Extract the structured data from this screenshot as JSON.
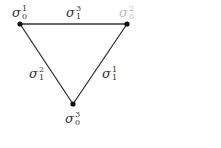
{
  "diagram": {
    "type": "triangle-simplicial-complex",
    "line_color": "#333333",
    "vertex_color": "#111111",
    "vertices": [
      {
        "id": "v-top-left",
        "symbol": "σ",
        "sub": "0",
        "sup": "1",
        "x": 20,
        "y": 24,
        "faded": false
      },
      {
        "id": "v-top-right",
        "symbol": "σ",
        "sub": "0",
        "sup": "2",
        "x": 127,
        "y": 24,
        "faded": true
      },
      {
        "id": "v-bottom",
        "symbol": "σ",
        "sub": "0",
        "sup": "3",
        "x": 73,
        "y": 104,
        "faded": false
      }
    ],
    "edges": [
      {
        "id": "e-top",
        "from": "v-top-left",
        "to": "v-top-right",
        "symbol": "σ",
        "sub": "1",
        "sup": "3"
      },
      {
        "id": "e-left",
        "from": "v-top-left",
        "to": "v-bottom",
        "symbol": "σ",
        "sub": "1",
        "sup": "2"
      },
      {
        "id": "e-right",
        "from": "v-top-right",
        "to": "v-bottom",
        "symbol": "σ",
        "sub": "1",
        "sup": "1"
      }
    ]
  }
}
